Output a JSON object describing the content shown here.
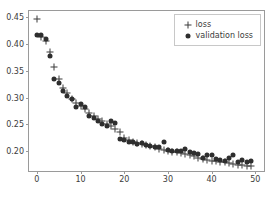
{
  "chart_data": {
    "type": "scatter",
    "title": "",
    "xlabel": "",
    "ylabel": "",
    "xlim": [
      -1.8,
      52.0
    ],
    "ylim": [
      0.163,
      0.462
    ],
    "grid": false,
    "legend_position": "upper right",
    "xticks": [
      0,
      10,
      20,
      30,
      40,
      50
    ],
    "xtick_labels": [
      "0",
      "10",
      "20",
      "30",
      "40",
      "50"
    ],
    "yticks": [
      0.2,
      0.25,
      0.3,
      0.35,
      0.4,
      0.45
    ],
    "ytick_labels": [
      "0.20",
      "0.25",
      "0.30",
      "0.35",
      "0.40",
      "0.45"
    ],
    "x": [
      0,
      1,
      2,
      3,
      4,
      5,
      6,
      7,
      8,
      9,
      10,
      11,
      12,
      13,
      14,
      15,
      16,
      17,
      18,
      19,
      20,
      21,
      22,
      23,
      24,
      25,
      26,
      27,
      28,
      29,
      30,
      31,
      32,
      33,
      34,
      35,
      36,
      37,
      38,
      39,
      40,
      41,
      42,
      43,
      44,
      45,
      46,
      47,
      48,
      49
    ],
    "series": [
      {
        "name": "loss",
        "marker": "plus",
        "color": "#3a3a3a",
        "values": [
          0.447,
          0.414,
          0.406,
          0.386,
          0.357,
          0.334,
          0.318,
          0.309,
          0.297,
          0.291,
          0.285,
          0.279,
          0.272,
          0.266,
          0.261,
          0.256,
          0.251,
          0.247,
          0.242,
          0.236,
          0.225,
          0.221,
          0.218,
          0.215,
          0.213,
          0.211,
          0.209,
          0.207,
          0.205,
          0.203,
          0.2,
          0.199,
          0.198,
          0.197,
          0.195,
          0.193,
          0.191,
          0.188,
          0.186,
          0.184,
          0.182,
          0.181,
          0.18,
          0.179,
          0.178,
          0.177,
          0.175,
          0.174,
          0.173,
          0.172
        ]
      },
      {
        "name": "validation loss",
        "marker": "dot",
        "color": "#2e2e2e",
        "values": [
          0.417,
          0.418,
          0.409,
          0.377,
          0.334,
          0.328,
          0.313,
          0.303,
          0.297,
          0.282,
          0.288,
          0.282,
          0.266,
          0.262,
          0.256,
          0.25,
          0.248,
          0.256,
          0.253,
          0.223,
          0.221,
          0.218,
          0.217,
          0.213,
          0.216,
          0.212,
          0.21,
          0.208,
          0.207,
          0.218,
          0.203,
          0.201,
          0.2,
          0.2,
          0.205,
          0.199,
          0.197,
          0.195,
          0.188,
          0.193,
          0.192,
          0.186,
          0.183,
          0.182,
          0.188,
          0.192,
          0.18,
          0.184,
          0.179,
          0.182
        ]
      }
    ],
    "legend": [
      {
        "label": "loss",
        "marker": "plus"
      },
      {
        "label": "validation loss",
        "marker": "dot"
      }
    ]
  }
}
